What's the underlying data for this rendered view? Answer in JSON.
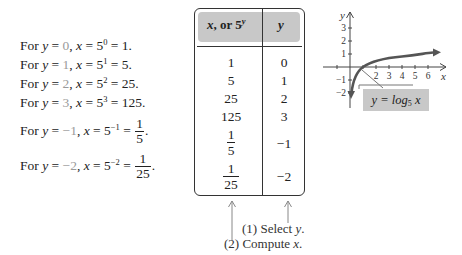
{
  "computations": [
    {
      "prefix": "For ",
      "yvar": "y",
      "eq1": " = ",
      "yval": "0",
      "comma": ", ",
      "xvar": "x",
      "eq2": " = 5",
      "exp": "0",
      "eq3": " = ",
      "result": "1",
      "end": "."
    },
    {
      "prefix": "For ",
      "yvar": "y",
      "eq1": " = ",
      "yval": "1",
      "comma": ", ",
      "xvar": "x",
      "eq2": " = 5",
      "exp": "1",
      "eq3": " = ",
      "result": "5",
      "end": "."
    },
    {
      "prefix": "For ",
      "yvar": "y",
      "eq1": " = ",
      "yval": "2",
      "comma": ", ",
      "xvar": "x",
      "eq2": " = 5",
      "exp": "2",
      "eq3": " = ",
      "result": "25",
      "end": "."
    },
    {
      "prefix": "For ",
      "yvar": "y",
      "eq1": " = ",
      "yval": "3",
      "comma": ", ",
      "xvar": "x",
      "eq2": " = 5",
      "exp": "3",
      "eq3": " = ",
      "result": "125",
      "end": "."
    },
    {
      "prefix": "For ",
      "yvar": "y",
      "eq1": " = ",
      "yval": "−1",
      "comma": ", ",
      "xvar": "x",
      "eq2": " = 5",
      "exp": "−1",
      "eq3": " = ",
      "num": "1",
      "den": "5",
      "end": "."
    },
    {
      "prefix": "For ",
      "yvar": "y",
      "eq1": " = ",
      "yval": "−2",
      "comma": ", ",
      "xvar": "x",
      "eq2": " = 5",
      "exp": "−2",
      "eq3": " = ",
      "num": "1",
      "den": "25",
      "end": "."
    }
  ],
  "table": {
    "header_x_var": "x",
    "header_x_mid": ", or 5",
    "header_x_exp": "y",
    "header_y": "y",
    "rows": [
      {
        "x": "1",
        "y": "0"
      },
      {
        "x": "5",
        "y": "1"
      },
      {
        "x": "25",
        "y": "2"
      },
      {
        "x": "125",
        "y": "3"
      },
      {
        "x_num": "1",
        "x_den": "5",
        "y": "−1"
      },
      {
        "x_num": "1",
        "x_den": "25",
        "y": "−2"
      }
    ]
  },
  "notes": {
    "step1_prefix": "(1) Select ",
    "step1_var": "y",
    "step1_end": ".",
    "step2_prefix": "(2) Compute ",
    "step2_var": "x",
    "step2_end": "."
  },
  "graph": {
    "x_axis_label": "x",
    "y_axis_label": "y",
    "x_ticks": [
      "2",
      "3",
      "4",
      "5",
      "6"
    ],
    "y_ticks": [
      "3",
      "2",
      "1",
      "−1",
      "−2"
    ],
    "label_lhs": "y = log",
    "label_base": "5",
    "label_var": "x",
    "colors": {
      "curve": "#555555",
      "label_bg": "#c8c8c8",
      "axes": "#444444"
    }
  }
}
